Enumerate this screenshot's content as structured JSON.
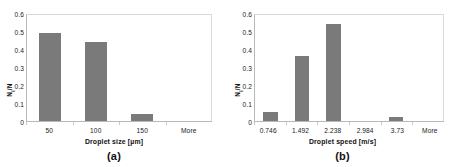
{
  "figure": {
    "background": "#ffffff",
    "bar_color": "#7a7a7a",
    "axis_color": "#b9b9b9"
  },
  "panels": [
    {
      "caption": "(a)",
      "chart_data": {
        "type": "bar",
        "title": "",
        "xlabel": "Droplet size [µm]",
        "ylabel": "Nᵢ/N",
        "ylabel_main": "N",
        "ylabel_sub": "i",
        "ylabel_tail": "/N",
        "categories": [
          "50",
          "100",
          "150",
          "More"
        ],
        "values": [
          0.5,
          0.45,
          0.04,
          0.0
        ],
        "ylim": [
          0,
          0.6
        ],
        "yticks": [
          "0.6",
          "0.5",
          "0.4",
          "0.3",
          "0.2",
          "0.1",
          "0"
        ],
        "ytick_values": [
          0.6,
          0.5,
          0.4,
          0.3,
          0.2,
          0.1,
          0
        ],
        "grid": false,
        "legend": "none"
      }
    },
    {
      "caption": "(b)",
      "chart_data": {
        "type": "bar",
        "title": "",
        "xlabel": "Droplet speed [m/s]",
        "ylabel": "Nᵢ/N",
        "ylabel_main": "N",
        "ylabel_sub": "i",
        "ylabel_tail": "/N",
        "categories": [
          "0.746",
          "1.492",
          "2.238",
          "2.984",
          "3.73",
          "More"
        ],
        "values": [
          0.05,
          0.37,
          0.55,
          0.0,
          0.02,
          0.0
        ],
        "ylim": [
          0,
          0.6
        ],
        "yticks": [
          "0.6",
          "0.5",
          "0.4",
          "0.3",
          "0.2",
          "0.1",
          "0"
        ],
        "ytick_values": [
          0.6,
          0.5,
          0.4,
          0.3,
          0.2,
          0.1,
          0
        ],
        "grid": false,
        "legend": "none"
      }
    }
  ]
}
